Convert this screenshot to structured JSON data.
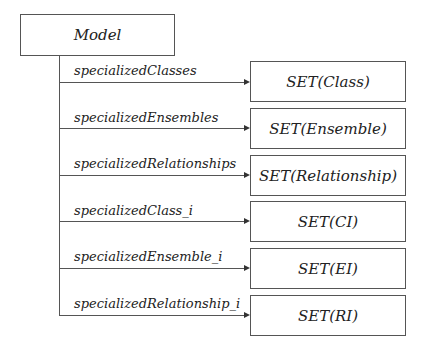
{
  "diagram": {
    "root": {
      "label": "Model"
    },
    "relations": [
      {
        "label": "specializedClasses",
        "target": "SET(Class)"
      },
      {
        "label": "specializedEnsembles",
        "target": "SET(Ensemble)"
      },
      {
        "label": "specializedRelationships",
        "target": "SET(Relationship)"
      },
      {
        "label": "specializedClass_i",
        "target": "SET(CI)"
      },
      {
        "label": "specializedEnsemble_i",
        "target": "SET(EI)"
      },
      {
        "label": "specializedRelationship_i",
        "target": "SET(RI)"
      }
    ]
  }
}
